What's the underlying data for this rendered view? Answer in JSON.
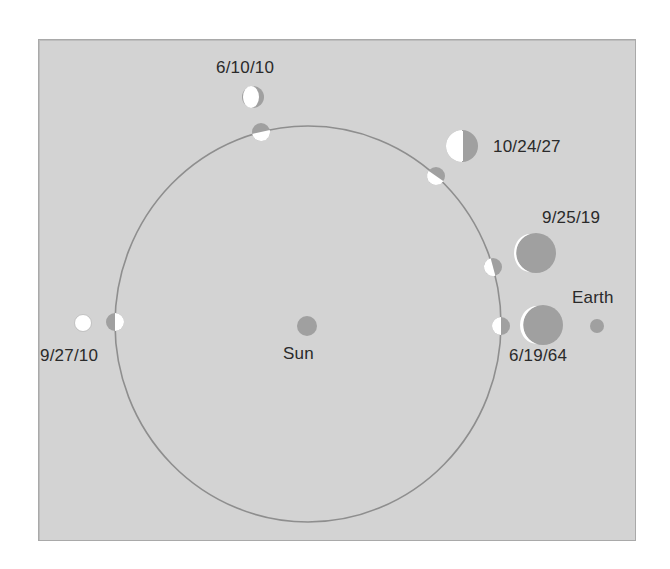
{
  "colors": {
    "background": "#d3d3d3",
    "orbit": "#8e8e8e",
    "planet_dark": "#a0a0a0",
    "planet_light": "#ffffff",
    "label": "#2a2a2a"
  },
  "labels": {
    "sun": "Sun",
    "earth": "Earth",
    "date_1": "6/10/10",
    "date_2": "10/24/27",
    "date_3": "9/25/19",
    "date_4": "6/19/64",
    "date_5": "9/27/10"
  },
  "bodies": {
    "sun": {
      "x": 307,
      "y": 326,
      "r": 10
    },
    "earth": {
      "x": 597,
      "y": 326,
      "r": 7
    },
    "orbit": {
      "cx": 308,
      "cy": 324,
      "rx": 193,
      "ry": 198
    }
  },
  "venus_phases": [
    {
      "date": "6/10/10",
      "orbit_pos": [
        261,
        132
      ],
      "view_pos": [
        253,
        97
      ],
      "view_r": 11
    },
    {
      "date": "10/24/27",
      "orbit_pos": [
        436,
        176
      ],
      "view_pos": [
        462,
        146
      ],
      "view_r": 16
    },
    {
      "date": "9/25/19",
      "orbit_pos": [
        493,
        267
      ],
      "view_pos": [
        536,
        253
      ],
      "view_r": 20
    },
    {
      "date": "6/19/64",
      "orbit_pos": [
        501,
        326
      ],
      "view_pos": [
        543,
        325
      ],
      "view_r": 20
    },
    {
      "date": "9/27/10",
      "orbit_pos": [
        115,
        322
      ],
      "view_pos": [
        83,
        323
      ],
      "view_r": 8
    }
  ]
}
